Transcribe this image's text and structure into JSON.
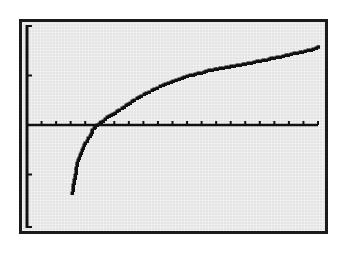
{
  "chart_data": {
    "type": "line",
    "title": "",
    "xlabel": "",
    "ylabel": "",
    "xlim": [
      0,
      20
    ],
    "ylim": [
      -2,
      2
    ],
    "xscl": 1,
    "yscl": 1,
    "grid": false,
    "legend": null,
    "style": "calculator-graph-screen",
    "series": [
      {
        "name": "Y1",
        "x": [
          3.1,
          3.3,
          3.5,
          3.8,
          4.0,
          4.3,
          4.5,
          4.8,
          5.2,
          5.5,
          5.9,
          6.5,
          7.2,
          8.2,
          9.5,
          11.0,
          12.9,
          15.2,
          17.2,
          19.5,
          20.0
        ],
        "y": [
          -1.37,
          -1.01,
          -0.71,
          -0.51,
          -0.36,
          -0.22,
          -0.1,
          0.0,
          0.08,
          0.16,
          0.22,
          0.34,
          0.48,
          0.65,
          0.83,
          0.99,
          1.13,
          1.25,
          1.37,
          1.52,
          1.58
        ]
      }
    ]
  },
  "colors": {
    "screen_background": "#e4e4e4",
    "frame": "#1a1a1a",
    "plot_ink": "#111111",
    "page_background": "#ffffff"
  },
  "layout": {
    "origin_px": [
      27,
      125
    ],
    "px_per_x_unit": 14.55,
    "px_per_y_unit": 49.5,
    "y_axis_px": {
      "x": 27,
      "top": 25,
      "bottom": 228
    },
    "x_axis_px": {
      "y": 125,
      "left": 27,
      "right": 318
    }
  },
  "labels": {
    "graph_description": "Graph screen showing logarithmic-type curve crossing x-axis near x=5"
  }
}
